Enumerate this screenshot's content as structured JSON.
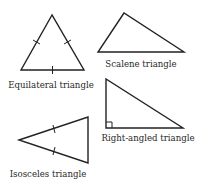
{
  "diagram": {
    "stroke_color": "#222222",
    "text_color": "#2a2a2a",
    "triangles": [
      {
        "id": "equilateral",
        "label": "Equilateral triangle",
        "points": [
          [
            52,
            15
          ],
          [
            21,
            70
          ],
          [
            84,
            70
          ]
        ],
        "tick_marks": 3,
        "label_pos": [
          51,
          88
        ]
      },
      {
        "id": "scalene",
        "label": "Scalene triangle",
        "points": [
          [
            124,
            13
          ],
          [
            98,
            52
          ],
          [
            184,
            52
          ]
        ],
        "tick_marks": 0,
        "label_pos": [
          141,
          67
        ]
      },
      {
        "id": "right-angled",
        "label": "Right-angled triangle",
        "points": [
          [
            106,
            79
          ],
          [
            106,
            128
          ],
          [
            183,
            128
          ]
        ],
        "right_angle_marker": true,
        "label_pos": [
          148,
          141
        ]
      },
      {
        "id": "isosceles",
        "label": "Isosceles triangle",
        "points": [
          [
            19,
            140
          ],
          [
            88,
            117
          ],
          [
            88,
            163
          ]
        ],
        "tick_marks": 2,
        "label_pos": [
          48,
          177
        ]
      }
    ]
  }
}
